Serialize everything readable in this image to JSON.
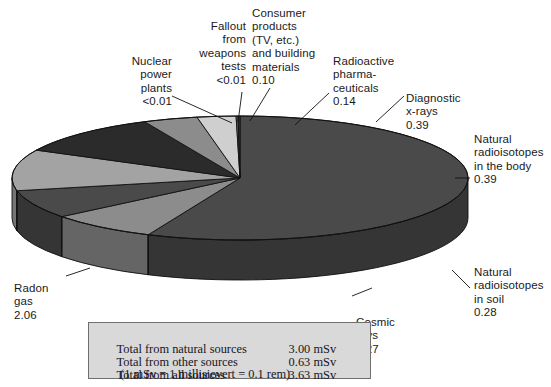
{
  "chart_data": {
    "type": "pie",
    "title": "",
    "unit": "mSv",
    "total": 3.63,
    "start_angle_deg": 0,
    "direction": "clockwise",
    "three_d": true,
    "categories": [
      "Radon gas",
      "Natural radioisotopes in soil",
      "Cosmic rays",
      "Natural radioisotopes in the body",
      "Diagnostic x-rays",
      "Radioactive pharmaceuticals",
      "Consumer products (TV, etc.) and building materials",
      "Fallout from weapons tests",
      "Nuclear power plants"
    ],
    "values": [
      2.06,
      0.28,
      0.27,
      0.39,
      0.39,
      0.14,
      0.1,
      0.005,
      0.005
    ],
    "value_labels": [
      "2.06",
      "0.28",
      "0.27",
      "0.39",
      "0.39",
      "0.14",
      "0.10",
      "<0.01",
      "<0.01"
    ],
    "slice_colors": [
      "#4a4a4a",
      "#8c8c8c",
      "#4a4a4a",
      "#a3a3a3",
      "#2b2b2b",
      "#8c8c8c",
      "#cfcfcf",
      "#6e6e6e",
      "#3a3a3a"
    ],
    "legend_position": "none",
    "labels_position": "outside-with-leader-lines"
  },
  "labels": {
    "nuclear_power": "Nuclear\npower\nplants\n<0.01",
    "fallout": "Fallout\nfrom\nweapons\ntests\n<0.01",
    "consumer_products": "Consumer\nproducts\n(TV,  etc.)\nand building\nmaterials\n0.10",
    "radiopharma": "Radioactive\npharma-\nceuticals\n0.14",
    "diagnostic_xrays": "Diagnostic\nx-rays\n0.39",
    "body_isotopes": "Natural\nradioisotopes\nin the body\n0.39",
    "soil_isotopes": "Natural\nradioisotopes\nin soil\n0.28",
    "cosmic_rays": "Cosmic\nrays\n0.27",
    "radon_gas": "Radon\ngas\n2.06"
  },
  "totals": {
    "rows": [
      {
        "name": "Total from natural sources",
        "value": "3.00 mSv"
      },
      {
        "name": "Total from other sources",
        "value": "0.63 mSv"
      },
      {
        "name": "Total from all sources",
        "value": "3.63 mSv"
      }
    ],
    "note": "(1 mSv = 1 millisievert = 0.1 rem)"
  },
  "colors": {
    "text": "#1a1a1a",
    "box_fill": "#d9d9d9",
    "box_border": "#6f6f6f",
    "outline": "#111111"
  }
}
